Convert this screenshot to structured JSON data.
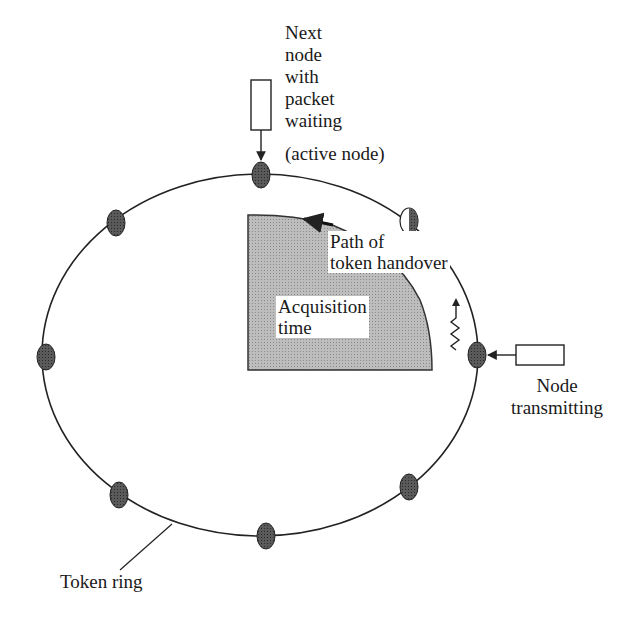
{
  "diagram": {
    "type": "token-ring",
    "labels": {
      "next_node": [
        "Next",
        "node",
        "with",
        "packet",
        "waiting"
      ],
      "active_node": "(active node)",
      "path_of_handover": [
        "Path of",
        "token handover"
      ],
      "acquisition_time": [
        "Acquisition",
        "time"
      ],
      "node_transmitting": [
        "Node",
        "transmitting"
      ],
      "token_ring": "Token ring"
    },
    "nodes": [
      {
        "id": "top",
        "state": "active"
      },
      {
        "id": "top-right",
        "state": "token-leaving"
      },
      {
        "id": "right",
        "state": "transmitting"
      },
      {
        "id": "bottom-right",
        "state": "idle"
      },
      {
        "id": "bottom",
        "state": "idle"
      },
      {
        "id": "bottom-left",
        "state": "idle"
      },
      {
        "id": "left",
        "state": "idle"
      },
      {
        "id": "top-left",
        "state": "idle"
      }
    ],
    "colors": {
      "line": "#222222",
      "node_fill": "#555555",
      "region_fill": "#b4b4b4"
    }
  }
}
